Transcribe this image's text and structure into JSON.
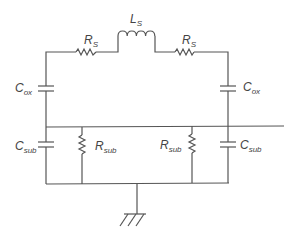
{
  "diagram": {
    "type": "equivalent-circuit",
    "components": {
      "inductor": {
        "label": "L",
        "subscript": "S"
      },
      "series_resistor_left": {
        "label": "R",
        "subscript": "S"
      },
      "series_resistor_right": {
        "label": "R",
        "subscript": "S"
      },
      "oxide_cap_left": {
        "label": "C",
        "subscript": "ox"
      },
      "oxide_cap_right": {
        "label": "C",
        "subscript": "ox"
      },
      "substrate_cap_left": {
        "label": "C",
        "subscript": "sub"
      },
      "substrate_resistor_left": {
        "label": "R",
        "subscript": "sub"
      },
      "substrate_resistor_right": {
        "label": "R",
        "subscript": "sub"
      },
      "substrate_cap_right": {
        "label": "C",
        "subscript": "sub"
      }
    },
    "ground": "ground-symbol"
  }
}
